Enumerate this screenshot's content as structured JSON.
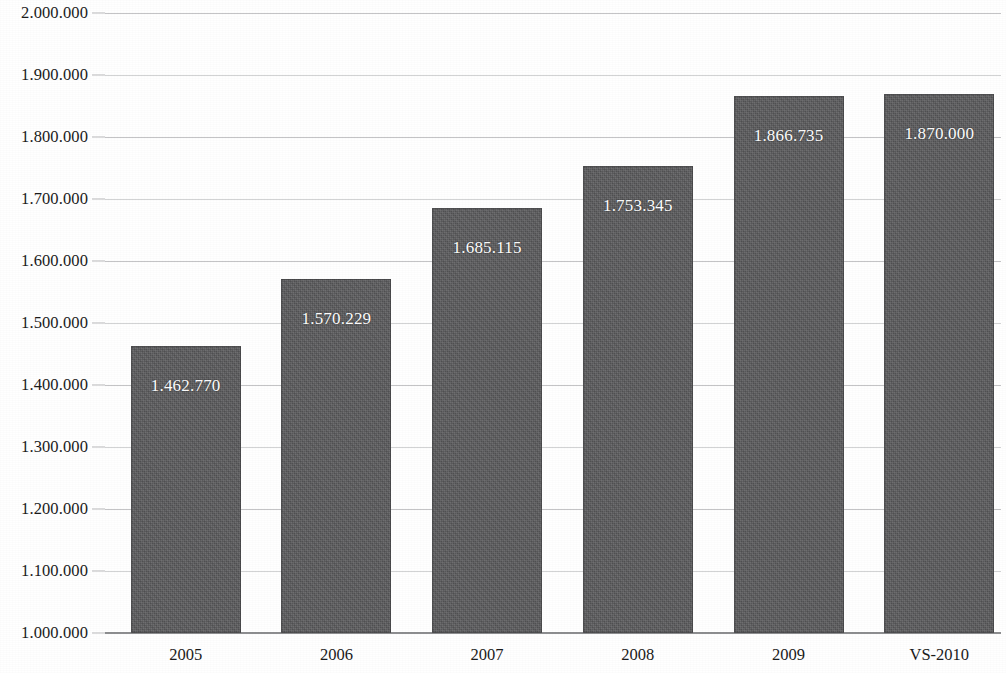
{
  "chart_data": {
    "type": "bar",
    "title": "",
    "subtitle": "",
    "xlabel": "",
    "ylabel": "",
    "categories": [
      "2005",
      "2006",
      "2007",
      "2008",
      "2009",
      "VS-2010"
    ],
    "values": [
      1462770,
      1570229,
      1685115,
      1753345,
      1866735,
      1870000
    ],
    "value_labels": [
      "1.462.770",
      "1.570.229",
      "1.685.115",
      "1.753.345",
      "1.866.735",
      "1.870.000"
    ],
    "ylim": [
      1000000,
      2000000
    ],
    "ytick_labels": [
      "2.000.000",
      "1.900.000",
      "1.800.000",
      "1.700.000",
      "1.600.000",
      "1.500.000",
      "1.400.000",
      "1.300.000",
      "1.200.000",
      "1.100.000",
      "1.000.000"
    ],
    "ytick_values": [
      2000000,
      1900000,
      1800000,
      1700000,
      1600000,
      1500000,
      1400000,
      1300000,
      1200000,
      1100000,
      1000000
    ],
    "ytick_step": 100000,
    "grid": true,
    "grid_axis": "y",
    "legend": false,
    "legend_position": "none",
    "number_format": "European (period thousands separator)",
    "colors": {
      "bar_fill": "#5a5a5c",
      "bar_label_text": "#fdfdfd",
      "gridline": "#c4c4c6",
      "baseline": "#8d8e90",
      "axis_text": "#1b1b1b",
      "background": "#ffffff"
    }
  }
}
